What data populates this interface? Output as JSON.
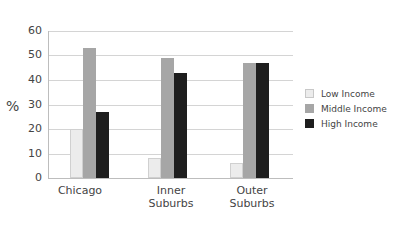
{
  "chart_data": {
    "type": "bar",
    "title": "",
    "xlabel": "",
    "ylabel": "%",
    "ylim": [
      0,
      60
    ],
    "yticks": [
      "0",
      "10",
      "20",
      "30",
      "40",
      "50",
      "60"
    ],
    "grid": true,
    "legend_position": "right",
    "categories": [
      "Chicago",
      "Inner Suburbs",
      "Outer Suburbs"
    ],
    "series": [
      {
        "name": "Low Income",
        "color": "#ececec",
        "values": [
          20,
          8,
          6
        ]
      },
      {
        "name": "Middle Income",
        "color": "#a6a6a6",
        "values": [
          53,
          49,
          47
        ]
      },
      {
        "name": "High Income",
        "color": "#1e1e1e",
        "values": [
          27,
          43,
          47
        ]
      }
    ]
  },
  "labels": {
    "ylabel": "%",
    "cat0": "Chicago",
    "cat1a": "Inner",
    "cat1b": "Suburbs",
    "cat2a": "Outer",
    "cat2b": "Suburbs",
    "leg0": "Low Income",
    "leg1": "Middle Income",
    "leg2": "High Income"
  }
}
